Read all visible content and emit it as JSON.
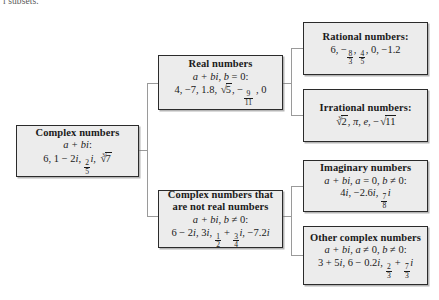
{
  "page": {
    "cutoff_line": "l subsets."
  },
  "diagram": {
    "type": "hierarchy-tree",
    "orientation": "left-to-right",
    "box_fill": "#ececec",
    "box_border": "#2b2b2b",
    "connector_color": "#9a9a9a",
    "root": {
      "id": "complex-numbers",
      "title": "Complex numbers",
      "form": "a + bi:",
      "examples": "6, 1 − 2i, (2/5)i, ∛7",
      "examples_parts": [
        "6",
        "1 − 2i",
        "2/5 i",
        "cube root of 7"
      ]
    },
    "level2": [
      {
        "id": "real-numbers",
        "title": "Real numbers",
        "form": "a + bi, b = 0:",
        "examples": "4, −7, 1.8, √5, −(9/11), 0",
        "examples_parts": [
          "4",
          "−7",
          "1.8",
          "square root of 5",
          "−9/11",
          "0"
        ]
      },
      {
        "id": "complex-not-real",
        "title_line1": "Complex numbers that",
        "title_line2": "are not real numbers",
        "form": "a + bi, b ≠ 0:",
        "examples": "6 − 2i, 3i, 1/2 + (3/4)i, −7.2i",
        "examples_parts": [
          "6 − 2i",
          "3i",
          "1/2 + 3/4 i",
          "−7.2i"
        ]
      }
    ],
    "level3": [
      {
        "id": "rational-numbers",
        "title": "Rational numbers:",
        "examples": "6, −(8/3), 4/5, 0, −1.2",
        "examples_parts": [
          "6",
          "−8/3",
          "4/5",
          "0",
          "−1.2"
        ]
      },
      {
        "id": "irrational-numbers",
        "title": "Irrational numbers:",
        "examples": "∛2, π, e, −√11",
        "examples_parts": [
          "cube root of 2",
          "π",
          "e",
          "− square root of 11"
        ]
      },
      {
        "id": "imaginary-numbers",
        "title": "Imaginary numbers",
        "form": "a + bi, a = 0, b ≠ 0:",
        "examples": "4i, −2.6i, (7/8)i",
        "examples_parts": [
          "4i",
          "−2.6i",
          "7/8 i"
        ]
      },
      {
        "id": "other-complex-numbers",
        "title": "Other complex numbers",
        "form": "a + bi, a ≠ 0, b ≠ 0:",
        "examples": "3 + 5i, 6 − 0.2i, 2/3 + (7/3)i",
        "examples_parts": [
          "3 + 5i",
          "6 − 0.2i",
          "2/3 + 7/3 i"
        ]
      }
    ]
  }
}
